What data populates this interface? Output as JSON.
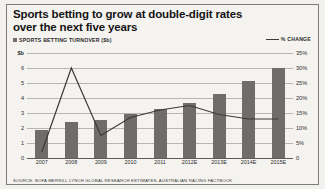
{
  "title": {
    "line1": "Sports betting to grow at double-digit rates",
    "line2": "over the next five years"
  },
  "legend": {
    "bar_label": "SPORTS BETTING TURNOVER ($b)",
    "line_label": "% CHANGE"
  },
  "source": "SOURCE: BOFA MERRILL LYNCH GLOBAL RESEARCH ESTIMATES, AUSTRALIAN RACING FACTBOOK",
  "chart_data": {
    "type": "bar",
    "title": "Sports betting to grow at double-digit rates over the next five years",
    "xlabel": "",
    "ylabel": "$b",
    "y2label": "% CHANGE",
    "grid": true,
    "legend_position": "top",
    "categories": [
      "2007",
      "2008",
      "2009",
      "2010",
      "2011",
      "2012E",
      "2013E",
      "2014E",
      "2015E"
    ],
    "series": [
      {
        "name": "SPORTS BETTING TURNOVER ($b)",
        "type": "bar",
        "axis": "left",
        "color": "#6e6d69",
        "values": [
          1.85,
          2.4,
          2.55,
          2.95,
          3.3,
          3.65,
          4.25,
          5.15,
          6.0
        ]
      },
      {
        "name": "% CHANGE",
        "type": "line",
        "axis": "right",
        "color": "#3b3a37",
        "values": [
          2,
          30,
          7.5,
          13.5,
          16,
          17.5,
          14.5,
          13,
          13
        ]
      }
    ],
    "ylim": [
      0,
      7
    ],
    "yticks": [
      "0",
      "1",
      "2",
      "3",
      "4",
      "5",
      "6",
      "$b"
    ],
    "y2lim": [
      0,
      35
    ],
    "y2ticks": [
      "0",
      "5%",
      "10%",
      "15%",
      "20%",
      "25%",
      "30%",
      "35%"
    ]
  }
}
